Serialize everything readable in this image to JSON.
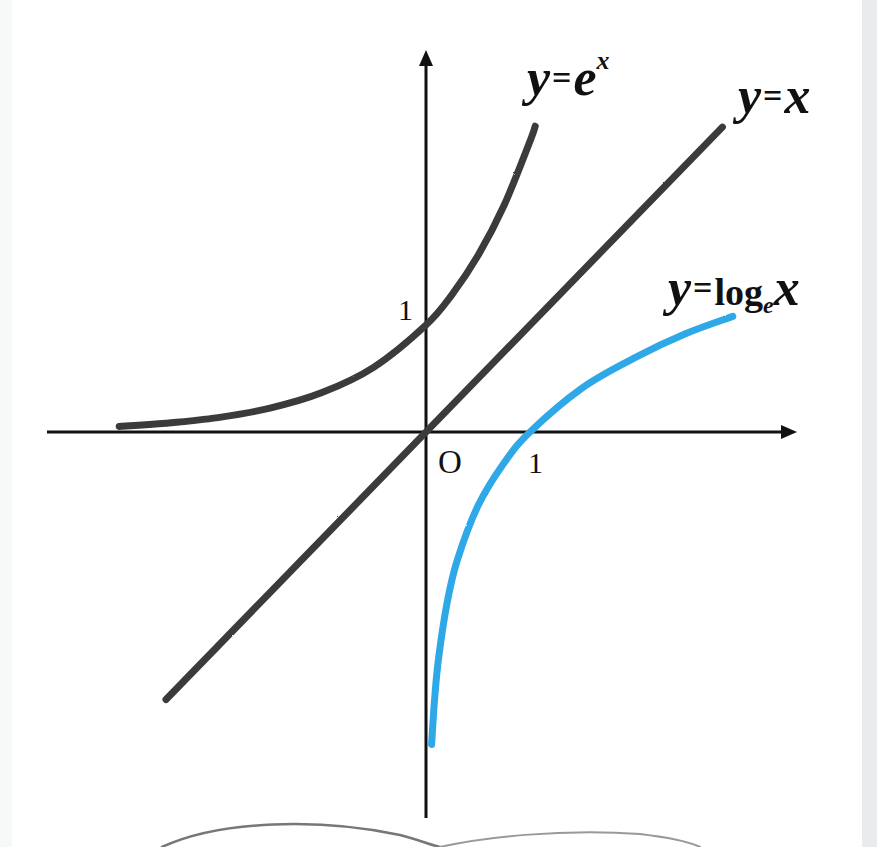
{
  "chart_data": {
    "type": "line",
    "title": "",
    "xlabel": "",
    "ylabel": "",
    "grid": false,
    "legend": "inline labels at curve ends",
    "origin_label": "O",
    "tick_labels": {
      "x": [
        "1"
      ],
      "y": [
        "1"
      ]
    },
    "xlim": [
      -3.6,
      3.5
    ],
    "ylim": [
      -3.6,
      3.5
    ],
    "series": [
      {
        "name": "y=e^x",
        "color": "#3a3a3a",
        "x": [
          -2.95,
          -2.5,
          -2,
          -1.5,
          -1,
          -0.5,
          0,
          0.25,
          0.5,
          0.75,
          1.0,
          1.05
        ],
        "y": [
          0.052,
          0.082,
          0.135,
          0.223,
          0.368,
          0.607,
          1.0,
          1.284,
          1.649,
          2.117,
          2.718,
          2.858
        ]
      },
      {
        "name": "y=x",
        "color": "#3a3a3a",
        "x": [
          -2.5,
          2.85
        ],
        "y": [
          -2.5,
          2.85
        ]
      },
      {
        "name": "y=log_e x",
        "color": "#2ea8e6",
        "x": [
          0.054,
          0.08,
          0.12,
          0.2,
          0.3,
          0.5,
          0.75,
          1.0,
          1.5,
          2.0,
          2.5,
          2.95
        ],
        "y": [
          -2.92,
          -2.53,
          -2.12,
          -1.61,
          -1.2,
          -0.69,
          -0.29,
          0.0,
          0.41,
          0.69,
          0.92,
          1.08
        ]
      }
    ],
    "annotations": [
      {
        "text": "1",
        "at": "y-axis, y=1"
      },
      {
        "text": "1",
        "at": "x-axis, x=1"
      },
      {
        "text": "O",
        "at": "origin"
      }
    ]
  },
  "labels": {
    "exp": {
      "y": "y",
      "eq": "=",
      "base": "e",
      "exp": "x"
    },
    "identity": {
      "y": "y",
      "eq": "=",
      "x": "x"
    },
    "log": {
      "y": "y",
      "eq": "=",
      "fn": "log",
      "base": "e",
      "x": "x"
    },
    "origin": "O",
    "x_tick": "1",
    "y_tick": "1"
  }
}
